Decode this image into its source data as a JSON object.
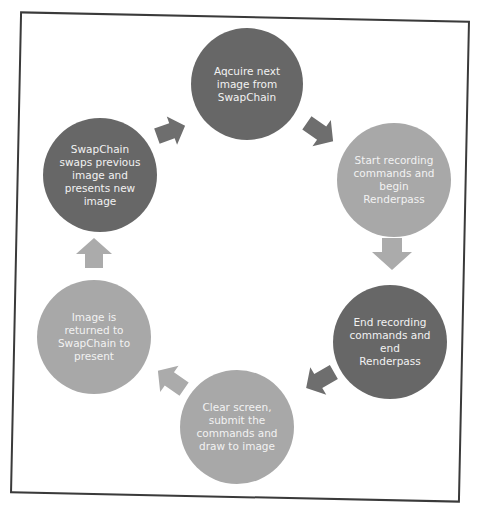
{
  "diagram": {
    "title": "",
    "type": "cycle",
    "colors": {
      "dark": "#676767",
      "medium": "#8c8c8c",
      "light": "#a8a8a8",
      "arrow_dark": "#6e6e6e",
      "arrow_light": "#ababab",
      "frame": "#3a3a3a",
      "text": "#f2f2f2"
    },
    "nodes": [
      {
        "id": "acquire",
        "label": "Aqcuire next\nimage from\nSwapChain",
        "shade": "dark"
      },
      {
        "id": "start-recording",
        "label": "Start recording\ncommands and\nbegin\nRenderpass",
        "shade": "light"
      },
      {
        "id": "end-recording",
        "label": "End recording\ncommands and\nend\nRenderpass",
        "shade": "dark"
      },
      {
        "id": "clear-submit",
        "label": "Clear screen,\nsubmit the\ncommands and\ndraw to image",
        "shade": "light"
      },
      {
        "id": "return-image",
        "label": "Image is\nreturned to\nSwapChain to\npresent",
        "shade": "light"
      },
      {
        "id": "swap-present",
        "label": "SwapChain\nswaps previous\nimage and\npresents new\nimage",
        "shade": "dark"
      }
    ],
    "edges": [
      {
        "from": "acquire",
        "to": "start-recording",
        "direction": "down-right"
      },
      {
        "from": "start-recording",
        "to": "end-recording",
        "direction": "down"
      },
      {
        "from": "end-recording",
        "to": "clear-submit",
        "direction": "down-left"
      },
      {
        "from": "clear-submit",
        "to": "return-image",
        "direction": "up-left"
      },
      {
        "from": "return-image",
        "to": "swap-present",
        "direction": "up"
      },
      {
        "from": "swap-present",
        "to": "acquire",
        "direction": "up-right"
      }
    ]
  }
}
